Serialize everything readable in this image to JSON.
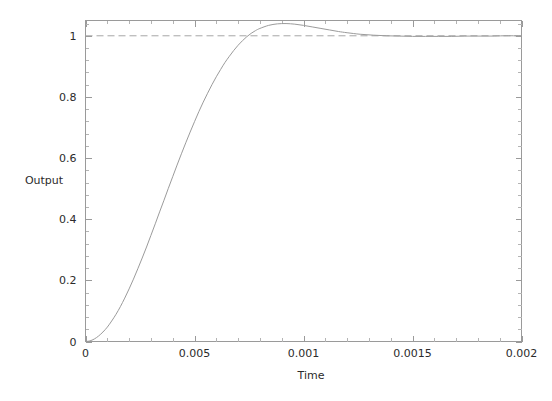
{
  "chart_data": {
    "type": "line",
    "title": "",
    "xlabel": "Time",
    "ylabel": "Output",
    "xlim": [
      0,
      0.002
    ],
    "ylim": [
      0,
      1.05
    ],
    "grid": false,
    "legend": "none",
    "xticks": [
      0,
      0.0005,
      0.001,
      0.0015,
      0.002
    ],
    "xticklabels": [
      "0",
      "0.005",
      "0.001",
      "0.0015",
      "0.002"
    ],
    "yticks": [
      0,
      0.2,
      0.4,
      0.6,
      0.8,
      1
    ],
    "yticklabels": [
      "0",
      "0.2",
      "0.4",
      "0.6",
      "0.8",
      "1"
    ],
    "x_minor_count": 5,
    "y_minor_count": 5,
    "series": [
      {
        "name": "step-response",
        "color": "#9b9b9b",
        "style": "solid",
        "x": [
          0,
          2e-05,
          4e-05,
          6e-05,
          8e-05,
          0.0001,
          0.00012,
          0.00014,
          0.00016,
          0.00018,
          0.0002,
          0.00022,
          0.00024,
          0.00026,
          0.00028,
          0.0003,
          0.00032,
          0.00034,
          0.00036,
          0.00038,
          0.0004,
          0.00042,
          0.00044,
          0.00046,
          0.00048,
          0.0005,
          0.00052,
          0.00054,
          0.00056,
          0.00058,
          0.0006,
          0.00062,
          0.00064,
          0.00066,
          0.00068,
          0.0007,
          0.00072,
          0.00074,
          0.00076,
          0.00078,
          0.0008,
          0.00084,
          0.00088,
          0.00092,
          0.00096,
          0.001,
          0.00104,
          0.00108,
          0.00112,
          0.00116,
          0.0012,
          0.00126,
          0.00132,
          0.00138,
          0.00144,
          0.0015,
          0.00156,
          0.00162,
          0.00168,
          0.00174,
          0.0018,
          0.00186,
          0.00192,
          0.002
        ],
        "y": [
          0,
          0.002,
          0.008,
          0.018,
          0.031,
          0.047,
          0.067,
          0.089,
          0.114,
          0.142,
          0.172,
          0.204,
          0.238,
          0.273,
          0.309,
          0.347,
          0.385,
          0.424,
          0.462,
          0.501,
          0.539,
          0.577,
          0.614,
          0.65,
          0.685,
          0.719,
          0.752,
          0.783,
          0.812,
          0.84,
          0.866,
          0.89,
          0.913,
          0.933,
          0.952,
          0.969,
          0.984,
          0.997,
          1.008,
          1.017,
          1.024,
          1.034,
          1.039,
          1.04,
          1.038,
          1.034,
          1.029,
          1.024,
          1.019,
          1.014,
          1.01,
          1.005,
          1.002,
          1.0,
          0.999,
          0.998,
          0.998,
          0.998,
          0.998,
          0.999,
          0.999,
          0.999,
          1.0,
          1.0
        ]
      }
    ],
    "reference_lines": [
      {
        "name": "steady-state-line",
        "orientation": "horizontal",
        "value": 1,
        "style": "dashed",
        "color": "#a6a6a6"
      }
    ],
    "annotations": {
      "peak_value": 1.04,
      "peak_time": 0.00092,
      "steady_state": 1
    }
  }
}
